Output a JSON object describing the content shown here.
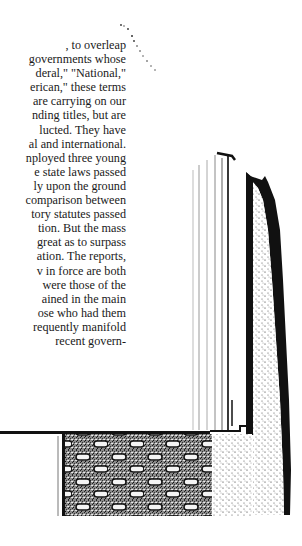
{
  "document": {
    "text_lines": [
      ", to overleap",
      "governments whose",
      "deral,\" \"National,\"",
      "erican,\" these terms",
      "are carrying on our",
      "nding titles, but are",
      "lucted.  They have",
      "al and international.",
      "nployed three young",
      "e state laws passed",
      "ly upon the ground",
      "comparison between",
      "tory statutes passed",
      "tion.  But the mass",
      "great as to surpass",
      "ation.  The reports,",
      "v in force are both",
      "were those of the",
      "ained in the main",
      "ose who had them",
      "requently manifold",
      "recent govern-"
    ]
  },
  "illustration": {
    "description": "engraved building facade with checkered brick base",
    "ink_color": "#111111",
    "paper_color": "#ffffff"
  }
}
